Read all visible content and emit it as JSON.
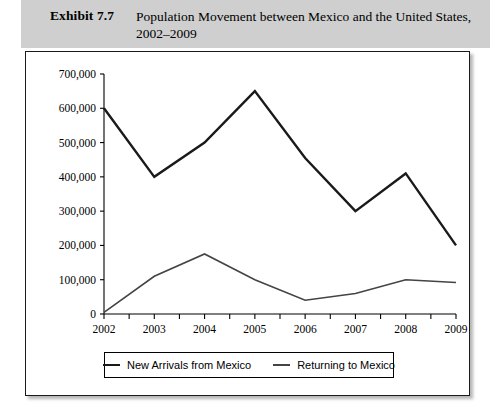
{
  "header": {
    "exhibit_label": "Exhibit 7.7",
    "title": "Population Movement between Mexico and the United States, 2002–2009",
    "band_color": "#cfcfcf"
  },
  "legend": {
    "series1_label": "New Arrivals from Mexico",
    "series2_label": "Returning to Mexico"
  },
  "chart_data": {
    "type": "line",
    "title": "Population Movement between Mexico and the United States, 2002–2009",
    "xlabel": "",
    "ylabel": "",
    "categories": [
      "2002",
      "2003",
      "2004",
      "2005",
      "2006",
      "2007",
      "2008",
      "2009"
    ],
    "x": [
      2002,
      2003,
      2004,
      2005,
      2006,
      2007,
      2008,
      2009
    ],
    "series": [
      {
        "name": "New Arrivals from Mexico",
        "color": "#1a1a1a",
        "width": 2.4,
        "values": [
          600000,
          400000,
          500000,
          650000,
          455000,
          300000,
          410000,
          200000
        ]
      },
      {
        "name": "Returning to Mexico",
        "color": "#444444",
        "width": 1.6,
        "values": [
          5000,
          110000,
          175000,
          100000,
          40000,
          60000,
          100000,
          92000
        ]
      }
    ],
    "ylim": [
      0,
      700000
    ],
    "ytick_values": [
      0,
      100000,
      200000,
      300000,
      400000,
      500000,
      600000,
      700000
    ],
    "ytick_labels": [
      "0",
      "100,000",
      "200,000",
      "300,000",
      "400,000",
      "500,000",
      "600,000",
      "700,000"
    ],
    "grid": false,
    "legend_position": "bottom"
  }
}
